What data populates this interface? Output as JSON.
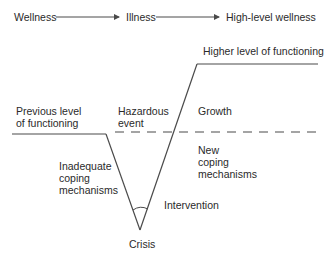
{
  "header_flow": {
    "steps": [
      "Wellness",
      "Illness",
      "High-level wellness"
    ]
  },
  "labels": {
    "higher_level": "Higher level of functioning",
    "previous_level_1": "Previous level",
    "previous_level_2": "of functioning",
    "hazardous_1": "Hazardous",
    "hazardous_2": "event",
    "growth": "Growth",
    "new_coping_1": "New",
    "new_coping_2": "coping",
    "new_coping_3": "mechanisms",
    "inadequate_1": "Inadequate",
    "inadequate_2": "coping",
    "inadequate_3": "mechanisms",
    "intervention": "Intervention",
    "crisis": "Crisis"
  },
  "colors": {
    "line": "#4a4a4a",
    "text": "#2a2a2a"
  }
}
